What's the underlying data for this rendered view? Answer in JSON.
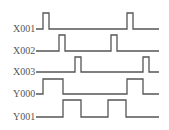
{
  "diagram": {
    "type": "timing-diagram",
    "line_color": "#555555",
    "background": "#ffffff",
    "signals": [
      {
        "name": "X001",
        "label_y": 32,
        "baseline_y": 29,
        "high_y": 13,
        "pulses": [
          [
            43,
            49
          ],
          [
            127,
            133
          ]
        ]
      },
      {
        "name": "X002",
        "label_y": 54,
        "baseline_y": 51,
        "high_y": 35,
        "pulses": [
          [
            59,
            65
          ],
          [
            111,
            117
          ]
        ]
      },
      {
        "name": "X003",
        "label_y": 75,
        "baseline_y": 72,
        "high_y": 57,
        "pulses": [
          [
            75,
            81
          ],
          [
            143,
            149
          ]
        ]
      },
      {
        "name": "Y000",
        "label_y": 97,
        "baseline_y": 94,
        "high_y": 79,
        "pulses": [
          [
            43,
            63
          ],
          [
            127,
            143
          ]
        ]
      },
      {
        "name": "Y001",
        "label_y": 120,
        "baseline_y": 117,
        "high_y": 100,
        "pulses": [
          [
            63,
            81
          ],
          [
            108,
            126
          ]
        ]
      }
    ],
    "x_start": 36,
    "x_end": 159
  }
}
